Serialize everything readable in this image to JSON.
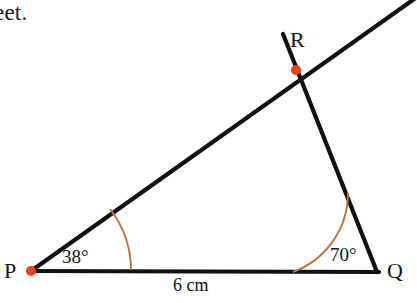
{
  "page": {
    "background_color": "#ffffff",
    "clipped_text": "eet."
  },
  "diagram": {
    "type": "triangle-construction",
    "line_color": "#111111",
    "arc_color": "#c0703c",
    "point_color": "#e8441a",
    "vertices": [
      {
        "id": "P",
        "label": "P",
        "x": 31,
        "y": 271
      },
      {
        "id": "Q",
        "label": "Q",
        "x": 377,
        "y": 272
      },
      {
        "id": "R",
        "label": "R",
        "x": 296,
        "y": 70
      }
    ],
    "angles": [
      {
        "at": "P",
        "label": "38°",
        "value": 38
      },
      {
        "at": "Q",
        "label": "70°",
        "value": 70
      }
    ],
    "sides": [
      {
        "from": "P",
        "to": "Q",
        "label": "6 cm",
        "length": 6,
        "unit": "cm"
      }
    ],
    "rays": [
      {
        "from": "P",
        "through": "R",
        "extends_beyond": true
      },
      {
        "from": "Q",
        "through": "R",
        "extends_beyond": true
      }
    ]
  }
}
